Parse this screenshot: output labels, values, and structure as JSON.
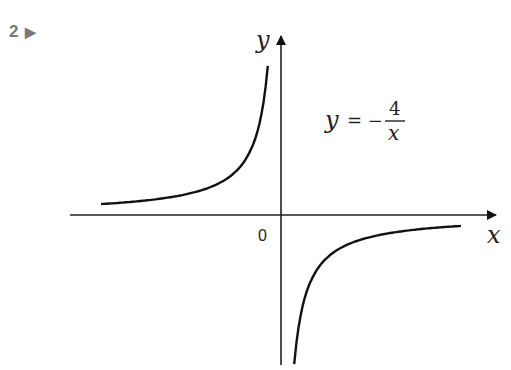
{
  "exercise": {
    "number": "2",
    "marker": "▶"
  },
  "chart_data": {
    "type": "line",
    "title": "",
    "function": "y = -4/x",
    "equation_label": {
      "lhs": "y",
      "eq": "= −",
      "numerator": "4",
      "denominator": "x"
    },
    "xlabel": "x",
    "ylabel": "y",
    "origin_label": "0",
    "grid": false,
    "legend": null,
    "series": [
      {
        "name": "left branch (x<0, y>0)",
        "x": [
          -7.5,
          -6,
          -5,
          -4,
          -3,
          -2,
          -1.5,
          -1,
          -0.75,
          -0.55
        ],
        "y": [
          0.53,
          0.67,
          0.8,
          1,
          1.33,
          2,
          2.67,
          4,
          5.33,
          7.27
        ]
      },
      {
        "name": "right branch (x>0, y<0)",
        "x": [
          0.55,
          0.75,
          1,
          1.5,
          2,
          3,
          4,
          5,
          6,
          7.5
        ],
        "y": [
          -7.27,
          -5.33,
          -4,
          -2.67,
          -2,
          -1.33,
          -1,
          -0.8,
          -0.67,
          -0.53
        ]
      }
    ],
    "asymptotes": [
      "x = 0",
      "y = 0"
    ]
  }
}
